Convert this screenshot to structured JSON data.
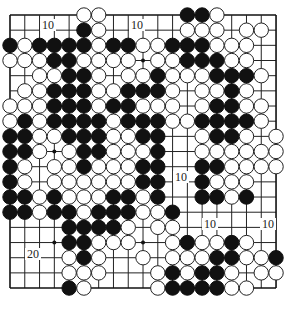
{
  "diagram": {
    "type": "go-board",
    "size": 19,
    "geometry": {
      "origin_x": 10,
      "origin_y": 15,
      "step_x": 14.78,
      "step_y": 15.17,
      "stone_radius": 7.2
    },
    "colors": {
      "black": "#111111",
      "white": "#ffffff",
      "line": "#222222",
      "background": "#ffffff"
    },
    "legend": {
      "B": "black stone",
      "W": "white stone",
      ".": "empty point"
    },
    "rows": [
      ".....WW.....BBW....",
      ".....BW.....WWW.WW.",
      "BWBBBBWBBWWBBBWWW..",
      "WWWBBWWWW.WWBBBWW..",
      "..WWBBW.WWBWWWBBBW.",
      ".WWBBBWWBBBW.WWBW..",
      "WWWBBBWBBWWW.WBBWW.",
      "WBWBBBBWBBBWWBBBBW.",
      "BBWWBBBWWBB..WBBW.W",
      "BBW.WBBWWWB..WWWWWW",
      "BW.WWBWWWBB..BBWWWW",
      "BW.WWWWWWBB..BWWW..",
      "BBWBWWWBBWB..BBWB..",
      "BBWBBWBBBWWB.......",
      "....BBBBW.WW.......",
      "....BBWWW..WBWWBW..",
      "....WBW..W.WWWBBWWB",
      "....WWW...WBWBBW.WW",
      "....BW....WBBBBWW.."
    ],
    "star_points": [
      [
        3,
        3
      ],
      [
        3,
        9
      ],
      [
        3,
        15
      ],
      [
        9,
        3
      ],
      [
        9,
        9
      ],
      [
        9,
        15
      ],
      [
        15,
        3
      ],
      [
        15,
        9
      ],
      [
        15,
        15
      ]
    ],
    "labels": [
      {
        "text": "10",
        "x": 48,
        "y": 29
      },
      {
        "text": "10",
        "x": 137,
        "y": 29
      },
      {
        "text": "10",
        "x": 181,
        "y": 181
      },
      {
        "text": "10",
        "x": 210,
        "y": 228
      },
      {
        "text": "10",
        "x": 268,
        "y": 228
      },
      {
        "text": "20",
        "x": 33,
        "y": 258
      }
    ]
  }
}
